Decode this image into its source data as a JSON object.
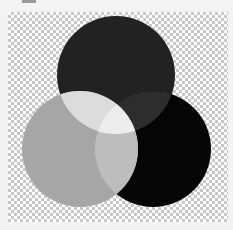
{
  "diagram": {
    "type": "venn",
    "background": "transparency-checkerboard",
    "circles": [
      {
        "name": "top",
        "color": "#222222"
      },
      {
        "name": "left",
        "color": "#a6a6a6"
      },
      {
        "name": "right",
        "color": "#050505"
      }
    ],
    "overlaps": {
      "top_left": "#dcdcdc",
      "top_right": "#2d2d2d",
      "left_right": "#bdbdbd",
      "all_three": "#ececec"
    }
  }
}
